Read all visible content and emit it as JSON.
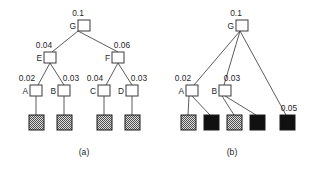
{
  "figure": {
    "background_color": "#ffffff",
    "line_color": "#4a4a4a",
    "node_fill": "#ffffff",
    "node_stroke": "#3a3a3a",
    "leaf_solid_color": "#111111",
    "leaf_hatch_color": "#8a8a8a"
  },
  "panels": [
    {
      "id": "panel-a",
      "caption": "(a)",
      "nodes": [
        {
          "id": "a-G",
          "label": "G",
          "prob": "0.1",
          "x": 78,
          "y": 20
        },
        {
          "id": "a-E",
          "label": "E",
          "prob": "0.04",
          "x": 44,
          "y": 52
        },
        {
          "id": "a-F",
          "label": "F",
          "prob": "0.06",
          "x": 112,
          "y": 52
        },
        {
          "id": "a-A",
          "label": "A",
          "prob": "0.02",
          "x": 30,
          "y": 85
        },
        {
          "id": "a-B",
          "label": "B",
          "prob": "0.03",
          "x": 58,
          "y": 85
        },
        {
          "id": "a-C",
          "label": "C",
          "prob": "0.04",
          "x": 98,
          "y": 85
        },
        {
          "id": "a-D",
          "label": "D",
          "prob": "0.03",
          "x": 126,
          "y": 85
        }
      ],
      "leaves": [
        {
          "id": "a-leaf-1",
          "style": "hatched",
          "x": 30,
          "y": 115
        },
        {
          "id": "a-leaf-2",
          "style": "hatched",
          "x": 58,
          "y": 115
        },
        {
          "id": "a-leaf-3",
          "style": "hatched",
          "x": 98,
          "y": 115
        },
        {
          "id": "a-leaf-4",
          "style": "hatched",
          "x": 126,
          "y": 115
        }
      ],
      "edges": [
        {
          "from": "a-G",
          "to": "a-E"
        },
        {
          "from": "a-G",
          "to": "a-F"
        },
        {
          "from": "a-E",
          "to": "a-A"
        },
        {
          "from": "a-E",
          "to": "a-B"
        },
        {
          "from": "a-F",
          "to": "a-C"
        },
        {
          "from": "a-F",
          "to": "a-D"
        },
        {
          "from": "a-A",
          "to": "a-leaf-1"
        },
        {
          "from": "a-B",
          "to": "a-leaf-2"
        },
        {
          "from": "a-C",
          "to": "a-leaf-3"
        },
        {
          "from": "a-D",
          "to": "a-leaf-4"
        }
      ]
    },
    {
      "id": "panel-b",
      "caption": "(b)",
      "nodes": [
        {
          "id": "b-G",
          "label": "G",
          "prob": "0.1",
          "x": 236,
          "y": 20
        },
        {
          "id": "b-A",
          "label": "A",
          "prob": "0.02",
          "x": 186,
          "y": 85
        },
        {
          "id": "b-B",
          "label": "B",
          "prob": "0.03",
          "x": 219,
          "y": 85
        }
      ],
      "leaves": [
        {
          "id": "b-leaf-1",
          "style": "hatched",
          "x": 181,
          "y": 115,
          "prob": ""
        },
        {
          "id": "b-leaf-2",
          "style": "solid",
          "x": 206,
          "y": 115,
          "prob": ""
        },
        {
          "id": "b-leaf-3",
          "style": "hatched",
          "x": 228,
          "y": 115,
          "prob": ""
        },
        {
          "id": "b-leaf-4",
          "style": "solid",
          "x": 252,
          "y": 115,
          "prob": ""
        },
        {
          "id": "b-leaf-5",
          "style": "solid",
          "x": 284,
          "y": 115,
          "prob": "0.05"
        }
      ],
      "edges": [
        {
          "from": "b-G",
          "to": "b-A"
        },
        {
          "from": "b-G",
          "to": "b-B"
        },
        {
          "from": "b-G",
          "to": "b-leaf-5"
        },
        {
          "from": "b-A",
          "to": "b-leaf-1"
        },
        {
          "from": "b-A",
          "to": "b-leaf-2"
        },
        {
          "from": "b-B",
          "to": "b-leaf-3"
        },
        {
          "from": "b-B",
          "to": "b-leaf-4"
        }
      ]
    }
  ]
}
